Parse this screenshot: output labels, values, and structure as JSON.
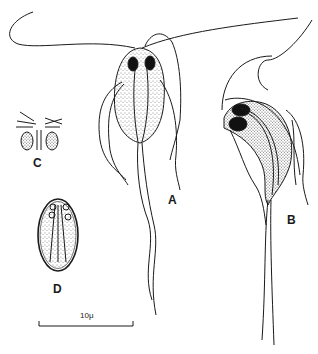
{
  "figure": {
    "labels": {
      "A": "A",
      "B": "B",
      "C": "C",
      "D": "D"
    },
    "scale_bar": {
      "text": "10μ"
    },
    "colors": {
      "ink": "#1a1a1a",
      "background": "#ffffff"
    }
  }
}
